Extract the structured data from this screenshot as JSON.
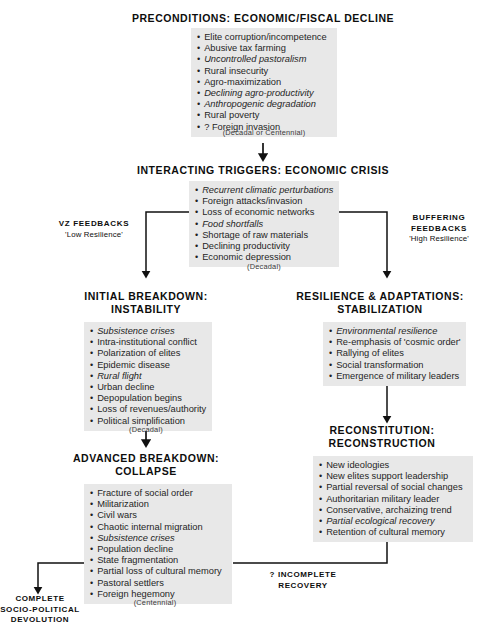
{
  "diagram": {
    "title_stage1": "PRECONDITIONS: ECONOMIC/FISCAL DECLINE",
    "title_stage2": "INTERACTING TRIGGERS: ECONOMIC CRISIS",
    "title_stage3_left_l1": "INITIAL BREAKDOWN:",
    "title_stage3_left_l2": "INSTABILITY",
    "title_stage3_right_l1": "RESILIENCE & ADAPTATIONS:",
    "title_stage3_right_l2": "STABILIZATION",
    "title_stage4_left_l1": "ADVANCED BREAKDOWN:",
    "title_stage4_left_l2": "COLLAPSE",
    "title_stage4_right_l1": "RECONSTITUTION:",
    "title_stage4_right_l2": "RECONSTRUCTION"
  },
  "boxes": {
    "preconditions": [
      {
        "text": "Elite corruption/incompetence",
        "italic": false
      },
      {
        "text": "Abusive tax farming",
        "italic": false
      },
      {
        "text": "Uncontrolled pastoralism",
        "italic": true
      },
      {
        "text": "Rural insecurity",
        "italic": false
      },
      {
        "text": "Agro-maximization",
        "italic": false
      },
      {
        "text": "Declining agro-productivity",
        "italic": true
      },
      {
        "text": "Anthropogenic degradation",
        "italic": true
      },
      {
        "text": "Rural poverty",
        "italic": false
      },
      {
        "text": "? Foreign invasion",
        "italic": false
      }
    ],
    "triggers": [
      {
        "text": "Recurrent climatic perturbations",
        "italic": true
      },
      {
        "text": "Foreign attacks/invasion",
        "italic": false
      },
      {
        "text": "Loss of economic networks",
        "italic": false
      },
      {
        "text": "Food shortfalls",
        "italic": true
      },
      {
        "text": "Shortage of raw materials",
        "italic": false
      },
      {
        "text": "Declining productivity",
        "italic": false
      },
      {
        "text": "Economic depression",
        "italic": false
      }
    ],
    "initial_breakdown": [
      {
        "text": "Subsistence crises",
        "italic": true
      },
      {
        "text": "Intra-institutional conflict",
        "italic": false
      },
      {
        "text": "Polarization of elites",
        "italic": false
      },
      {
        "text": "Epidemic disease",
        "italic": false
      },
      {
        "text": "Rural flight",
        "italic": true
      },
      {
        "text": "Urban decline",
        "italic": false
      },
      {
        "text": "Depopulation begins",
        "italic": false
      },
      {
        "text": "Loss of revenues/authority",
        "italic": false
      },
      {
        "text": "Political simplification",
        "italic": false
      }
    ],
    "resilience": [
      {
        "text": "Environmental resilience",
        "italic": true
      },
      {
        "text": "Re-emphasis of 'cosmic order'",
        "italic": false
      },
      {
        "text": "Rallying of elites",
        "italic": false
      },
      {
        "text": "Social transformation",
        "italic": false
      },
      {
        "text": "Emergence of military leaders",
        "italic": false
      }
    ],
    "advanced_breakdown": [
      {
        "text": "Fracture of social order",
        "italic": false
      },
      {
        "text": "Militarization",
        "italic": false
      },
      {
        "text": "Civil wars",
        "italic": false
      },
      {
        "text": "Chaotic internal migration",
        "italic": false
      },
      {
        "text": "Subsistence crises",
        "italic": true
      },
      {
        "text": "Population decline",
        "italic": false
      },
      {
        "text": "State fragmentation",
        "italic": false
      },
      {
        "text": "Partial loss of cultural memory",
        "italic": false
      },
      {
        "text": "Pastoral settlers",
        "italic": false
      },
      {
        "text": "Foreign hegemony",
        "italic": false
      }
    ],
    "reconstitution": [
      {
        "text": "New ideologies",
        "italic": false
      },
      {
        "text": "New elites support leadership",
        "italic": false
      },
      {
        "text": "Partial reversal of social changes",
        "italic": false
      },
      {
        "text": "Authoritarian military leader",
        "italic": false
      },
      {
        "text": "Conservative, archaizing trend",
        "italic": false
      },
      {
        "text": "Partial ecological recovery",
        "italic": true
      },
      {
        "text": "Retention of cultural memory",
        "italic": false
      }
    ]
  },
  "periods": {
    "p1": "(Decadal or Centennial)",
    "p2": "(Decadal)",
    "p3": "(Decadal)",
    "p4": "(Centennial)"
  },
  "feedbacks": {
    "left_title": "VZ  FEEDBACKS",
    "left_sub": "'Low Resilience'",
    "right_title_l1": "BUFFERING",
    "right_title_l2": "FEEDBACKS",
    "right_sub": "'High Resilience'"
  },
  "outcomes": {
    "devolution_l1": "COMPLETE",
    "devolution_l2": "SOCIO-POLITICAL",
    "devolution_l3": "DEVOLUTION",
    "recovery_l1": "? INCOMPLETE",
    "recovery_l2": "RECOVERY"
  },
  "colors": {
    "box_fill": "#e8e8e8",
    "line": "#111111",
    "text": "#1a1a1a",
    "background": "#ffffff"
  }
}
